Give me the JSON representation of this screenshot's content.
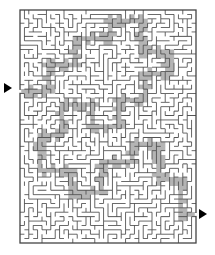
{
  "puzzle": {
    "type": "maze",
    "title": "Rectangular grid maze with shaded solution path",
    "orientation": "portrait"
  },
  "canvas": {
    "width": 215,
    "height": 255,
    "background_color": "#ffffff"
  },
  "maze": {
    "left": 20,
    "top": 10,
    "right": 196,
    "bottom": 243,
    "width": 176,
    "height": 233,
    "columns": 40,
    "rows": 53,
    "cell_width": 4.4,
    "cell_height": 4.4,
    "wall_color": "#555555",
    "wall_thickness": 0.9,
    "border_color": "#444444",
    "border_thickness": 1.3,
    "passage_color": "#ffffff",
    "solution_fill_color": "#b4b4b4",
    "solution_edge_color": "#8c8c8c",
    "seed": 20240517
  },
  "entry": {
    "label": "entry-arrow",
    "icon": "triangle-right-icon",
    "side": "left",
    "x": 4,
    "y": 83,
    "row": 18,
    "color": "#000000"
  },
  "exit": {
    "label": "exit-arrow",
    "icon": "triangle-right-icon",
    "side": "right",
    "x": 199,
    "y": 209,
    "row": 46,
    "color": "#000000"
  },
  "solution": {
    "visible": true,
    "description": "Shaded gray corridor running from the left entry across the middle, looping through the upper right block and down to the bottom right exit.",
    "waypoints": [
      [
        0,
        18
      ],
      [
        6,
        18
      ],
      [
        6,
        12
      ],
      [
        12,
        12
      ],
      [
        12,
        6
      ],
      [
        20,
        6
      ],
      [
        20,
        2
      ],
      [
        27,
        2
      ],
      [
        27,
        9
      ],
      [
        33,
        9
      ],
      [
        33,
        14
      ],
      [
        28,
        14
      ],
      [
        28,
        20
      ],
      [
        22,
        20
      ],
      [
        22,
        26
      ],
      [
        16,
        26
      ],
      [
        16,
        21
      ],
      [
        9,
        21
      ],
      [
        9,
        28
      ],
      [
        4,
        28
      ],
      [
        4,
        36
      ],
      [
        11,
        36
      ],
      [
        11,
        41
      ],
      [
        18,
        41
      ],
      [
        18,
        34
      ],
      [
        25,
        34
      ],
      [
        25,
        30
      ],
      [
        31,
        30
      ],
      [
        31,
        38
      ],
      [
        36,
        38
      ],
      [
        36,
        46
      ],
      [
        39,
        46
      ]
    ]
  }
}
